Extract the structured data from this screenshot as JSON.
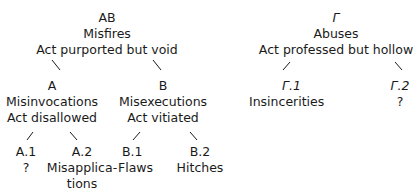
{
  "diagram": {
    "type": "tree",
    "root_left": {
      "code": "AB",
      "name": "Misfires",
      "description": "Act purported but void",
      "children": [
        {
          "code": "A",
          "name": "Misinvocations",
          "description": "Act disallowed",
          "children": [
            {
              "code": "A.1",
              "name": "?"
            },
            {
              "code": "A.2",
              "name_line1": "Misapplica-",
              "name_line2": "tions"
            }
          ]
        },
        {
          "code": "B",
          "name": "Misexecutions",
          "description": "Act vitiated",
          "children": [
            {
              "code": "B.1",
              "name": "Flaws"
            },
            {
              "code": "B.2",
              "name": "Hitches"
            }
          ]
        }
      ]
    },
    "root_right": {
      "code": "Γ",
      "name": "Abuses",
      "description": "Act professed but hollow",
      "children": [
        {
          "code": "Γ.1",
          "name": "Insincerities"
        },
        {
          "code": "Γ.2",
          "name": "?"
        }
      ]
    }
  }
}
